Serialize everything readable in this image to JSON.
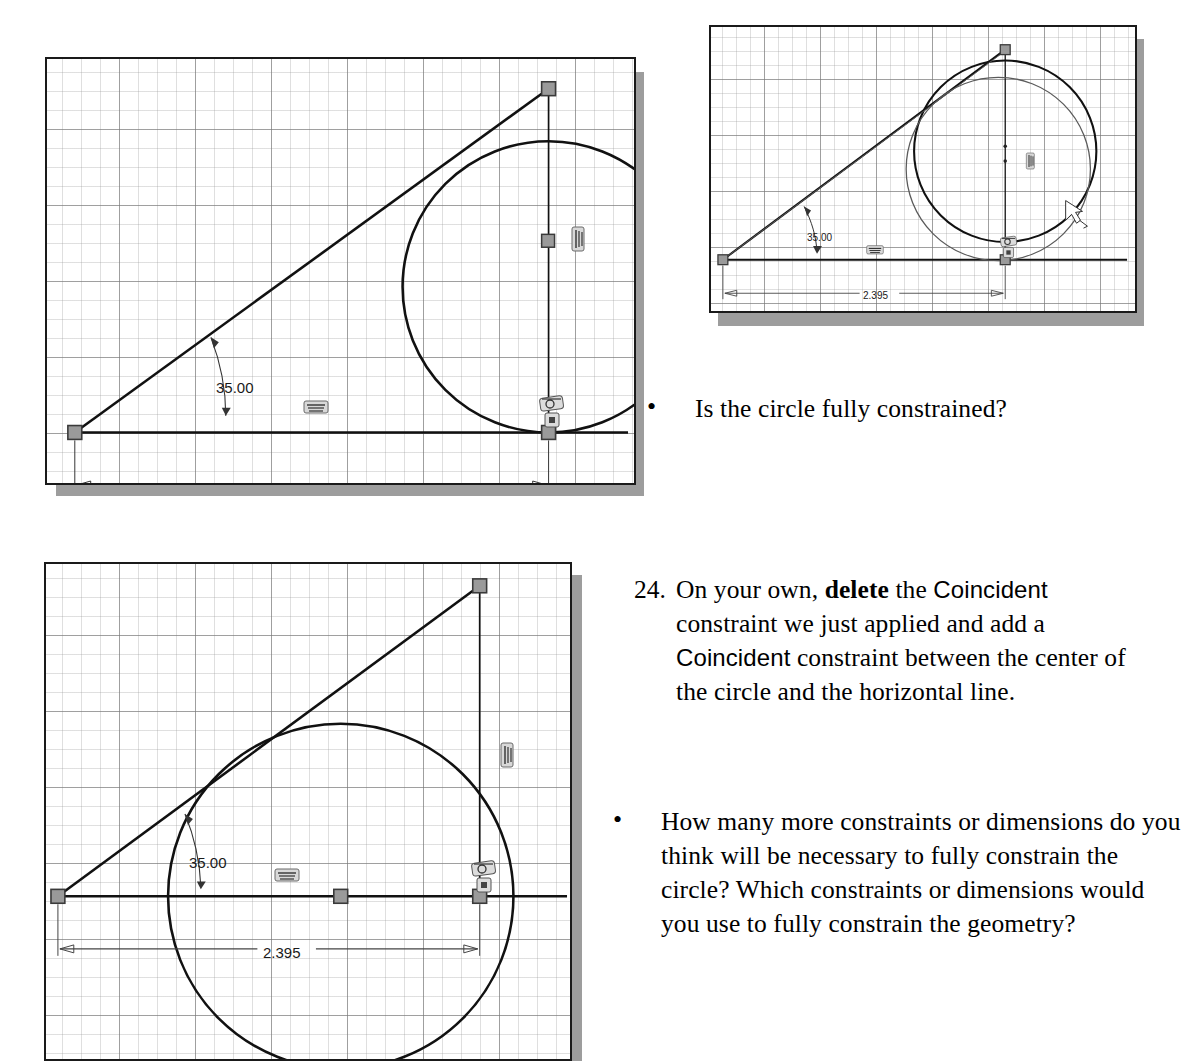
{
  "document": {
    "kind": "textbook-page-excerpt",
    "instructions": [
      {
        "number": "24.",
        "segments": [
          {
            "text": "On your own, ",
            "style": "serif"
          },
          {
            "text": "delete",
            "style": "serif-bold"
          },
          {
            "text": " the ",
            "style": "serif"
          },
          {
            "text": "Coincident",
            "style": "sans"
          },
          {
            "text": " constraint we just applied and add a ",
            "style": "serif"
          },
          {
            "text": "Coincident",
            "style": "sans"
          },
          {
            "text": " constraint between the center of the circle and the horizontal line.",
            "style": "serif"
          }
        ],
        "plain": "On your own, delete the Coincident constraint we just applied and add a Coincident constraint between the center of the circle and the horizontal line."
      }
    ],
    "bullets": [
      {
        "id": "bullet-fully-constrained",
        "text": "Is the circle fully constrained?"
      },
      {
        "id": "bullet-how-many-more",
        "text": "How many more constraints or dimensions do you think will be necessary to fully constrain the circle? Which constraints or dimensions would you use to fully constrain the geometry?"
      }
    ],
    "bullet_glyph": "•"
  },
  "figures": [
    {
      "id": "figure-top-left",
      "name": "sketch-before-constraint",
      "dimensions": [
        {
          "name": "angle-dimension",
          "value": "35.00"
        },
        {
          "name": "linear-dimension",
          "value": "2.395"
        }
      ],
      "constraint_icons": [
        {
          "name": "horizontal-constraint-icon"
        },
        {
          "name": "vertical-constraint-icon"
        },
        {
          "name": "tangent-constraint-icon"
        },
        {
          "name": "coincident-constraint-icon"
        }
      ],
      "entities": [
        "horizontal-line",
        "angled-line",
        "vertical-line",
        "circle"
      ]
    },
    {
      "id": "figure-top-right",
      "name": "sketch-dragging-preview",
      "dimensions": [
        {
          "name": "angle-dimension",
          "value": "35.00"
        },
        {
          "name": "linear-dimension",
          "value": "2.395"
        }
      ],
      "constraint_icons": [
        {
          "name": "horizontal-constraint-icon"
        },
        {
          "name": "vertical-constraint-icon"
        },
        {
          "name": "tangent-constraint-icon"
        },
        {
          "name": "coincident-constraint-icon"
        }
      ],
      "entities": [
        "horizontal-line",
        "angled-line",
        "vertical-line",
        "circle",
        "ghost-circle",
        "drag-cursor"
      ]
    },
    {
      "id": "figure-bottom-left",
      "name": "sketch-after-coincident-to-horizontal-line",
      "dimensions": [
        {
          "name": "angle-dimension",
          "value": "35.00"
        },
        {
          "name": "linear-dimension",
          "value": "2.395"
        }
      ],
      "constraint_icons": [
        {
          "name": "horizontal-constraint-icon"
        },
        {
          "name": "vertical-constraint-icon"
        },
        {
          "name": "tangent-constraint-icon"
        },
        {
          "name": "coincident-constraint-icon"
        }
      ],
      "entities": [
        "horizontal-line",
        "angled-line",
        "vertical-line",
        "circle",
        "center-point"
      ]
    }
  ],
  "colors": {
    "sketch_line": "#111111",
    "grid_minor": "#969696",
    "grid_major": "#787878",
    "panel_border": "#1a1a1a",
    "panel_shadow": "#9d9d9d",
    "dimension_text": "#1a1a1a",
    "point_handle": "#8f8f8f",
    "ghost_line": "#555555"
  }
}
